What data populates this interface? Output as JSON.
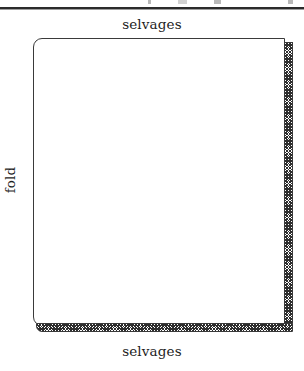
{
  "figure": {
    "name": "folded-fabric-diagram",
    "labels": {
      "selvages_top": "selvages",
      "selvages_bottom": "selvages",
      "fold": "fold"
    },
    "parts": {
      "sheet_name": "fabric-sheet",
      "right_selvage_name": "selvage-strip-right",
      "bottom_selvage_name": "selvage-strip-bottom",
      "fold_edge_name": "fold-edge"
    },
    "colors": {
      "ink": "#2b2b2b",
      "outline": "#3a3a3a",
      "hatch": "#2e2e2e",
      "paper": "#ffffff",
      "artifact": "#b9b9b9"
    },
    "rule": {
      "name": "top-rule",
      "position": "top"
    }
  }
}
